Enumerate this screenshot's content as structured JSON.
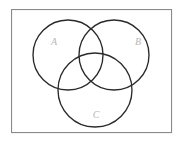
{
  "figure": {
    "kind": "venn-diagram",
    "title": "",
    "width": 181,
    "height": 143,
    "background_color": "#ffffff"
  },
  "frame": {
    "name": "universal-set-rectangle",
    "x": 11,
    "y": 9,
    "width": 161,
    "height": 124,
    "stroke_color": "#8a8a8a",
    "fill_color": "#ffffff",
    "stroke_width": 1.1
  },
  "circles": [
    {
      "id": "A",
      "label": "A",
      "cx": 68,
      "cy": 55,
      "r": 35,
      "stroke_color": "#2a2a2a",
      "stroke_width": 1.35
    },
    {
      "id": "B",
      "label": "B",
      "cx": 114,
      "cy": 55,
      "r": 35,
      "stroke_color": "#2a2a2a",
      "stroke_width": 1.35
    },
    {
      "id": "C",
      "label": "C",
      "cx": 95,
      "cy": 90,
      "r": 37,
      "stroke_color": "#2a2a2a",
      "stroke_width": 1.35
    }
  ],
  "labels": [
    {
      "id": "label-a",
      "text": "A",
      "x": 54,
      "y": 43,
      "color": "#b7b7b7",
      "font_size": 10,
      "italic": true
    },
    {
      "id": "label-b",
      "text": "B",
      "x": 138,
      "y": 43,
      "color": "#b7b7b7",
      "font_size": 10,
      "italic": true
    },
    {
      "id": "label-c",
      "text": "C",
      "x": 96,
      "y": 116,
      "color": "#b7b7b7",
      "font_size": 10,
      "italic": true
    }
  ]
}
